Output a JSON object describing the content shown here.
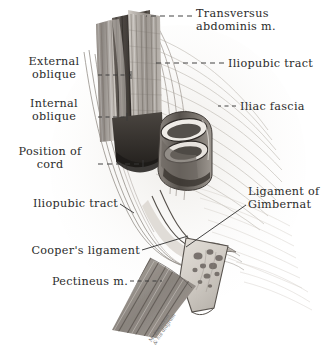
{
  "plate": {
    "medium": "grayscale anatomical illustration",
    "background_color": "#ffffff",
    "ink_color": "#2b2b2b",
    "region": "inguinal region, deep dissection"
  },
  "labels": [
    {
      "id": "transversus-abdominis",
      "text": "Transversus\nabdominis m.",
      "x": 196,
      "y": 8,
      "align": "left",
      "leader": {
        "type": "dashed",
        "x1": 192,
        "y1": 16,
        "x2": 146,
        "y2": 16
      }
    },
    {
      "id": "iliopubic-tract-upper",
      "text": "Iliopubic tract",
      "x": 228,
      "y": 58,
      "align": "left",
      "leader": {
        "type": "dashed",
        "x1": 224,
        "y1": 63,
        "x2": 152,
        "y2": 63
      }
    },
    {
      "id": "external-oblique",
      "text": "External\noblique",
      "x": 94,
      "y": 56,
      "align": "right",
      "leader": {
        "type": "dashed",
        "x1": 98,
        "y1": 75,
        "x2": 131,
        "y2": 75
      }
    },
    {
      "id": "iliac-fascia",
      "text": "Iliac fascia",
      "x": 240,
      "y": 101,
      "align": "left",
      "leader": {
        "type": "dashed",
        "x1": 236,
        "y1": 106,
        "x2": 218,
        "y2": 106
      }
    },
    {
      "id": "internal-oblique",
      "text": "Internal\noblique",
      "x": 94,
      "y": 98,
      "align": "right",
      "leader": {
        "type": "dashed",
        "x1": 98,
        "y1": 117,
        "x2": 127,
        "y2": 117
      }
    },
    {
      "id": "position-of-cord",
      "text": "Position of\ncord",
      "x": 94,
      "y": 146,
      "align": "right",
      "leader": {
        "type": "dashed",
        "x1": 98,
        "y1": 164,
        "x2": 143,
        "y2": 164
      }
    },
    {
      "id": "ligament-of-gimbernat",
      "text": "Ligament of\nGimbernat",
      "x": 248,
      "y": 186,
      "align": "left",
      "leader": {
        "type": "solid",
        "x1": 246,
        "y1": 205,
        "x2": 186,
        "y2": 247
      }
    },
    {
      "id": "iliopubic-tract-lower",
      "text": "Iliopubic tract",
      "x": 118,
      "y": 198,
      "align": "right",
      "leader": {
        "type": "solid",
        "x1": 120,
        "y1": 204,
        "x2": 130,
        "y2": 210
      }
    },
    {
      "id": "coopers-ligament",
      "text": "Cooper's ligament",
      "x": 140,
      "y": 245,
      "align": "right",
      "leader": {
        "type": "solid",
        "x1": 142,
        "y1": 250,
        "x2": 186,
        "y2": 236
      }
    },
    {
      "id": "pectineus",
      "text": "Pectineus m.",
      "x": 128,
      "y": 276,
      "align": "right",
      "leader": {
        "type": "dashed",
        "x1": 130,
        "y1": 281,
        "x2": 160,
        "y2": 281
      }
    }
  ],
  "signature": {
    "text": "M. Dennison\n& his diagram",
    "x": 148,
    "y": 340
  }
}
